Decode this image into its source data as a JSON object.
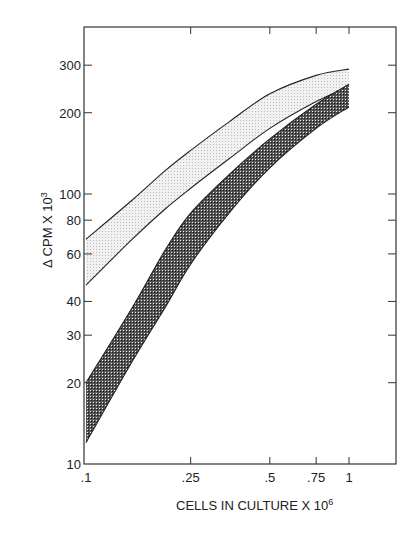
{
  "chart_data": {
    "type": "area",
    "title": "",
    "xlabel": "CELLS IN CULTURE X 10",
    "xlabel_sup": "6",
    "ylabel": "Δ CPM X 10",
    "ylabel_sup": "3",
    "xscale": "log",
    "yscale": "log",
    "xlim": [
      0.1,
      1.6
    ],
    "ylim": [
      10,
      420
    ],
    "grid": false,
    "legend": null,
    "x_ticks": [
      {
        "value": 0.1,
        "label": ".1"
      },
      {
        "value": 0.25,
        "label": ".25"
      },
      {
        "value": 0.5,
        "label": ".5"
      },
      {
        "value": 0.75,
        "label": ".75"
      },
      {
        "value": 1,
        "label": "1"
      }
    ],
    "y_ticks": [
      {
        "value": 10,
        "label": "10"
      },
      {
        "value": 20,
        "label": "20"
      },
      {
        "value": 30,
        "label": "30"
      },
      {
        "value": 40,
        "label": "40"
      },
      {
        "value": 60,
        "label": "60"
      },
      {
        "value": 80,
        "label": "80"
      },
      {
        "value": 100,
        "label": "100"
      },
      {
        "value": 200,
        "label": "200"
      },
      {
        "value": 300,
        "label": "300"
      }
    ],
    "x": [
      0.1,
      0.15,
      0.2,
      0.25,
      0.35,
      0.5,
      0.75,
      1.0
    ],
    "series": [
      {
        "name": "light band upper",
        "band": "light",
        "values": [
          68,
          95,
          122,
          145,
          185,
          235,
          275,
          290
        ]
      },
      {
        "name": "light band lower",
        "band": "light",
        "values": [
          46,
          68,
          88,
          105,
          135,
          175,
          220,
          250
        ]
      },
      {
        "name": "dark band upper",
        "band": "dark",
        "values": [
          20,
          38,
          62,
          85,
          118,
          160,
          215,
          255
        ]
      },
      {
        "name": "dark band lower",
        "band": "dark",
        "values": [
          12,
          24,
          38,
          55,
          85,
          125,
          175,
          210
        ]
      }
    ],
    "colors": {
      "light_band": "#d9d9d9",
      "dark_band": "#3a3a3a",
      "line": "#222222",
      "axis": "#333333"
    }
  }
}
